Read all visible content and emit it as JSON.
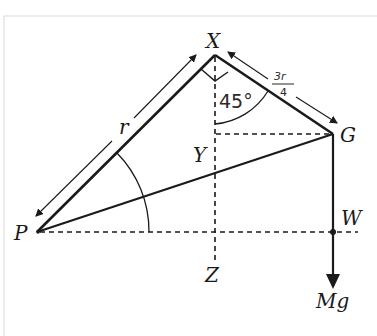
{
  "diagram": {
    "points": {
      "X": "X",
      "G": "G",
      "Y": "Y",
      "Z": "Z",
      "P": "P",
      "W": "W"
    },
    "labels": {
      "side_PX": "r",
      "side_XG_numerator": "3r",
      "side_XG_denominator": "4",
      "angle": "45°",
      "force": "Mg"
    },
    "colors": {
      "line": "#1a1a1a",
      "background": "#ffffff",
      "frame": "#e6e6e6"
    }
  }
}
